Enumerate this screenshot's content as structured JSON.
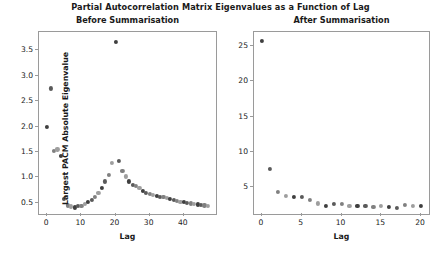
{
  "figure": {
    "suptitle": "Partial Autocorrelation Matrix Eigenvalues as a Function of Lag",
    "background": "#ffffff",
    "axis_color": "#9a9a9a",
    "text_color": "#1a1a1a"
  },
  "chart_data": [
    {
      "type": "scatter",
      "title": "Before Summarisation",
      "xlabel": "Lag",
      "ylabel": "Largest PACM Absolute Eigenvalue",
      "xlim": [
        -2.4,
        49.4
      ],
      "ylim": [
        0.28,
        3.86
      ],
      "xticks": [
        0,
        10,
        20,
        30,
        40
      ],
      "yticks": [
        0.5,
        1.0,
        1.5,
        2.0,
        2.5,
        3.0,
        3.5
      ],
      "grid": false,
      "legend": "none",
      "marker_size_px": 4.2,
      "marker_colors": [
        "#3f3f3f",
        "#5a5a5a",
        "#808080",
        "#9e9e9e"
      ],
      "x": [
        0,
        1,
        2,
        3,
        4,
        5,
        6,
        7,
        8,
        9,
        10,
        11,
        12,
        13,
        14,
        15,
        16,
        17,
        18,
        19,
        20,
        21,
        22,
        23,
        24,
        25,
        26,
        27,
        28,
        29,
        30,
        31,
        32,
        33,
        34,
        35,
        36,
        37,
        38,
        39,
        40,
        41,
        42,
        43,
        44,
        45,
        46,
        47
      ],
      "y": [
        1.99,
        2.75,
        1.52,
        1.55,
        1.43,
        0.58,
        0.45,
        0.43,
        0.41,
        0.44,
        0.44,
        0.48,
        0.52,
        0.56,
        0.62,
        0.69,
        0.8,
        0.92,
        1.05,
        1.28,
        3.66,
        1.32,
        1.13,
        1.02,
        0.92,
        0.86,
        0.83,
        0.8,
        0.74,
        0.7,
        0.68,
        0.66,
        0.63,
        0.62,
        0.61,
        0.59,
        0.58,
        0.56,
        0.54,
        0.52,
        0.51,
        0.5,
        0.49,
        0.48,
        0.47,
        0.46,
        0.45,
        0.44
      ]
    },
    {
      "type": "scatter",
      "title": "After Summarisation",
      "xlabel": "Lag",
      "ylabel": "",
      "xlim": [
        -1.0,
        21.0
      ],
      "ylim": [
        1.2,
        27.0
      ],
      "xticks": [
        0,
        5,
        10,
        15,
        20
      ],
      "yticks": [
        5,
        10,
        15,
        20,
        25
      ],
      "grid": false,
      "legend": "none",
      "marker_size_px": 4.2,
      "marker_colors": [
        "#3f3f3f",
        "#5a5a5a",
        "#808080",
        "#9e9e9e"
      ],
      "x": [
        0,
        1,
        2,
        3,
        4,
        5,
        6,
        7,
        8,
        9,
        10,
        11,
        12,
        13,
        14,
        15,
        16,
        17,
        18,
        19,
        20
      ],
      "y": [
        25.7,
        7.6,
        4.3,
        3.8,
        3.6,
        3.6,
        3.2,
        2.7,
        2.4,
        2.6,
        2.6,
        2.4,
        2.4,
        2.4,
        2.2,
        2.4,
        2.2,
        2.1,
        2.5,
        2.3,
        2.3
      ]
    }
  ]
}
